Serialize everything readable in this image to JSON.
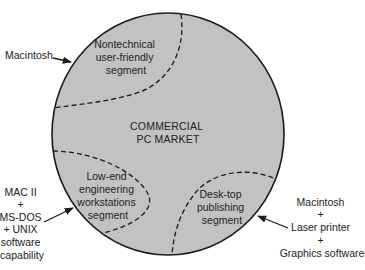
{
  "diagram": {
    "center_label": [
      "COMMERCIAL",
      "PC MARKET"
    ],
    "segments": [
      {
        "id": "nontechnical",
        "label": [
          "Nontechnical",
          "user-friendly",
          "segment"
        ]
      },
      {
        "id": "engineering",
        "label": [
          "Low-end",
          "engineering",
          "workstations",
          "segment"
        ]
      },
      {
        "id": "desktop",
        "label": [
          "Desk-top",
          "publishing",
          "segment"
        ]
      }
    ],
    "products": [
      {
        "id": "macintosh",
        "label": [
          "Macintosh"
        ]
      },
      {
        "id": "mac-ii",
        "label": [
          "MAC II",
          "+",
          "MS-DOS",
          "+  UNIX",
          "software",
          "capability"
        ]
      },
      {
        "id": "mac-laser",
        "label": [
          "Macintosh",
          "+",
          "Laser printer",
          "+",
          "Graphics software"
        ]
      }
    ],
    "colors": {
      "market_fill": "#c2c2c2",
      "outline": "#1a1a1a",
      "text": "#222222"
    }
  }
}
